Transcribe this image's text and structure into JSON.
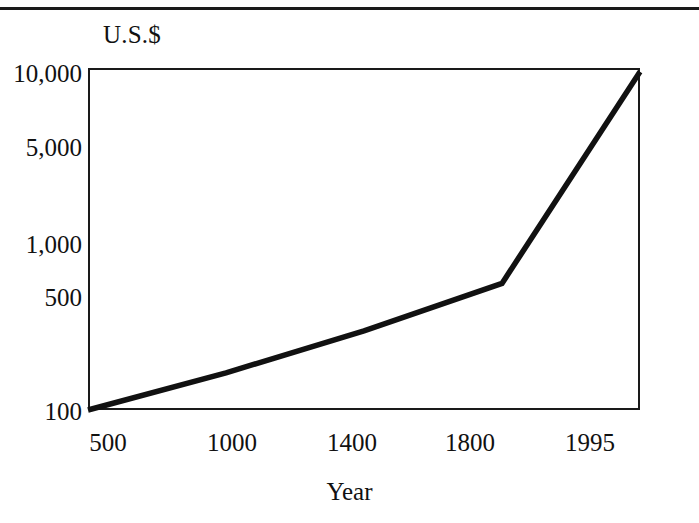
{
  "page": {
    "rule_color": "#1a1a1a"
  },
  "chart": {
    "y_axis_unit_label": "U.S.$",
    "x_axis_title": "Year",
    "line_color": "#111111",
    "frame_color": "#1a1a1a",
    "background_color": "#ffffff"
  },
  "chart_data": {
    "type": "line",
    "title": "",
    "subtitle": "",
    "xlabel": "Year",
    "ylabel": "U.S.$",
    "x": [
      "500",
      "1000",
      "1400",
      "1800",
      "1995"
    ],
    "categories": [
      "500",
      "1000",
      "1400",
      "1800",
      "1995"
    ],
    "x_tick_labels": [
      "500",
      "1000",
      "1400",
      "1800",
      "1995"
    ],
    "y_tick_labels": [
      "100",
      "500",
      "1,000",
      "5,000",
      "10,000"
    ],
    "y_tick_values": [
      100,
      500,
      1000,
      5000,
      10000
    ],
    "yscale": "log",
    "ylim": [
      100,
      10000
    ],
    "grid": false,
    "legend": false,
    "series": [
      {
        "name": "GDP per capita",
        "values": [
          100,
          165,
          290,
          550,
          9500
        ]
      }
    ],
    "annotations": []
  }
}
